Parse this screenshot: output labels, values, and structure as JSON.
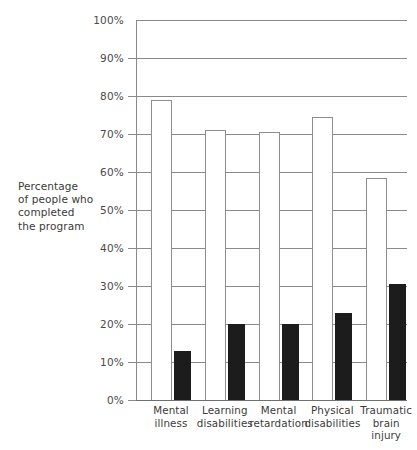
{
  "chart_data": {
    "type": "bar",
    "title": "",
    "xlabel": "",
    "ylabel": "Percentage of people who completed the program",
    "ylabel_lines": [
      "Percentage",
      "of people who",
      "completed",
      "the program"
    ],
    "categories": [
      "Mental illness",
      "Learning disabilities",
      "Mental retardation",
      "Physical disabilities",
      "Traumatic brain injury"
    ],
    "category_lines": [
      [
        "Mental",
        "illness"
      ],
      [
        "Learning",
        "disabilities"
      ],
      [
        "Mental",
        "retardation"
      ],
      [
        "Physical",
        "disabilities"
      ],
      [
        "Traumatic",
        "brain",
        "injury"
      ]
    ],
    "series": [
      {
        "name": "white-bar",
        "color": "#ffffff",
        "values": [
          79,
          71,
          70.5,
          74.5,
          58.5
        ]
      },
      {
        "name": "black-bar",
        "color": "#1c1c1c",
        "values": [
          13,
          20,
          20,
          23,
          30.5
        ]
      }
    ],
    "ylim": [
      0,
      100
    ],
    "ytick_values": [
      0,
      10,
      20,
      30,
      40,
      50,
      60,
      70,
      80,
      90,
      100
    ],
    "ytick_labels": [
      "0%",
      "10%",
      "20%",
      "30%",
      "40%",
      "50%",
      "60%",
      "70%",
      "80%",
      "90%",
      "100%"
    ],
    "grid": true,
    "legend": "none"
  }
}
